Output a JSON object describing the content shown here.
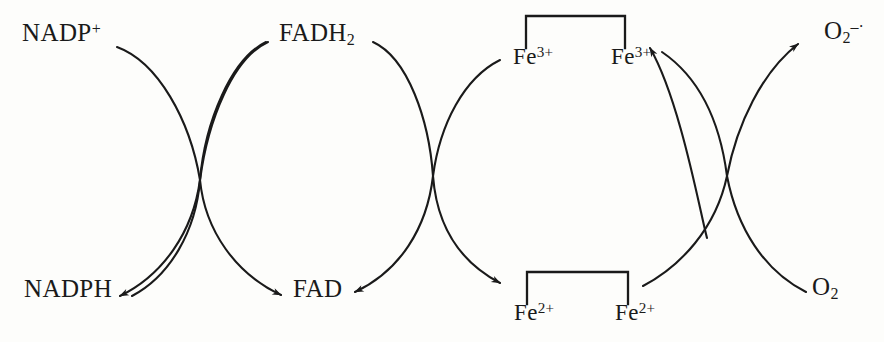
{
  "diagram": {
    "background_color": "#fdfdfb",
    "stroke_color": "#1a1a1a",
    "labels": {
      "nadp_plus": "NADP",
      "nadp_plus_sup": "+",
      "fadh2": "FADH",
      "fadh2_sub": "2",
      "fe3_left": "Fe",
      "fe3_left_sup": "3+",
      "fe3_right": "Fe",
      "fe3_right_sup": "3+",
      "superoxide": "O",
      "superoxide_sub": "2",
      "superoxide_sup": "–·",
      "nadph": "NADPH",
      "fad": "FAD",
      "fe2_left": "Fe",
      "fe2_left_sup": "2+",
      "fe2_right": "Fe",
      "fe2_right_sup": "2+",
      "o2": "O",
      "o2_sub": "2"
    },
    "brackets": {
      "top": {
        "x_left": 526,
        "x_right": 625,
        "y_bar": 16,
        "y_ends": 48
      },
      "bottom": {
        "x_left": 527,
        "x_right": 628,
        "y_bar": 272,
        "y_ends": 304
      }
    },
    "crossings": [
      {
        "x": 200,
        "y": 180
      },
      {
        "x": 433,
        "y": 176
      },
      {
        "x": 727,
        "y": 176
      }
    ],
    "arrows": [
      {
        "from": "FADH2",
        "to": "NADP+",
        "direction": "up-left"
      },
      {
        "from": "NADPH",
        "to": "FAD",
        "direction": "down-right"
      },
      {
        "from": "FADH2",
        "to": "Fe3+ bracket",
        "direction": "down-right"
      },
      {
        "from": "Fe2+ bracket",
        "to": "FAD",
        "direction": "up-left"
      },
      {
        "from": "Fe2+ bracket",
        "to": "Fe3+ right",
        "direction": "up-left"
      },
      {
        "from": "Fe3+ bracket",
        "to": "Fe2+ left",
        "direction": "down-right"
      },
      {
        "from": "O2",
        "to": "superoxide",
        "direction": "up-left"
      },
      {
        "from": "Fe2+",
        "to": "O2 reduction",
        "direction": "down-right"
      }
    ]
  }
}
